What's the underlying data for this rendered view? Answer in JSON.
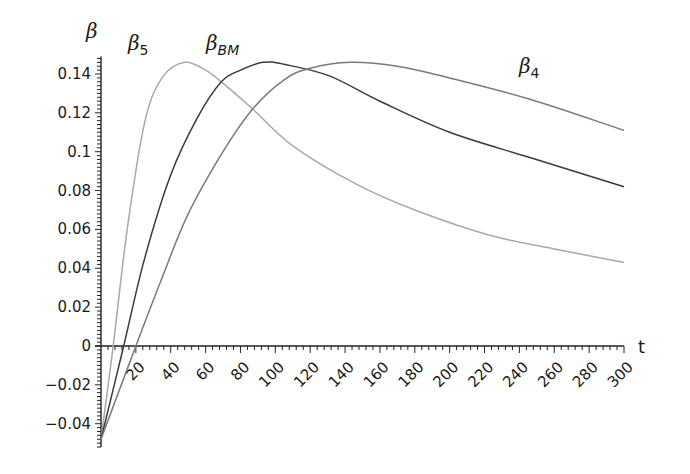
{
  "chart_data": {
    "type": "line",
    "title": "",
    "xlabel": "t",
    "ylabel": "β",
    "xlim": [
      0,
      300
    ],
    "ylim": [
      -0.05,
      0.15
    ],
    "grid": false,
    "legend": "inline labels",
    "x_ticks": [
      20,
      40,
      60,
      80,
      100,
      120,
      140,
      160,
      180,
      200,
      220,
      240,
      260,
      280,
      300
    ],
    "y_ticks": [
      -0.04,
      -0.02,
      0,
      0.02,
      0.04,
      0.06,
      0.08,
      0.1,
      0.12,
      0.14
    ],
    "y_tick_labels": [
      "−0.04",
      "−0.02",
      "0",
      "0.02",
      "0.04",
      "0.06",
      "0.08",
      "0.1",
      "0.12",
      "0.14"
    ],
    "series": [
      {
        "name": "β5",
        "label_main": "β",
        "label_sub": "5",
        "color": "#a8a8a8",
        "x": [
          0,
          7,
          15,
          25,
          35,
          48,
          60,
          69,
          87,
          110,
          147,
          180,
          223,
          260,
          300
        ],
        "values": [
          -0.048,
          0,
          0.06,
          0.115,
          0.138,
          0.146,
          0.142,
          0.136,
          0.122,
          0.103,
          0.083,
          0.07,
          0.057,
          0.05,
          0.043
        ]
      },
      {
        "name": "βBM",
        "label_main": "β",
        "label_sub": "BM",
        "color": "#3a3a3a",
        "x": [
          0,
          13,
          25,
          40,
          55,
          69,
          80,
          93,
          105,
          131,
          160,
          200,
          246,
          300
        ],
        "values": [
          -0.048,
          0,
          0.045,
          0.088,
          0.117,
          0.136,
          0.142,
          0.146,
          0.145,
          0.139,
          0.126,
          0.11,
          0.097,
          0.082
        ]
      },
      {
        "name": "β4",
        "label_main": "β",
        "label_sub": "4",
        "color": "#7a7a7a",
        "x": [
          0,
          20,
          35,
          50,
          70,
          87,
          105,
          120,
          143,
          170,
          200,
          246,
          300
        ],
        "values": [
          -0.048,
          0,
          0.035,
          0.068,
          0.1,
          0.122,
          0.137,
          0.143,
          0.146,
          0.144,
          0.138,
          0.127,
          0.111
        ]
      }
    ]
  },
  "axes": {
    "x_axis_label": "t",
    "y_axis_label": "β"
  }
}
